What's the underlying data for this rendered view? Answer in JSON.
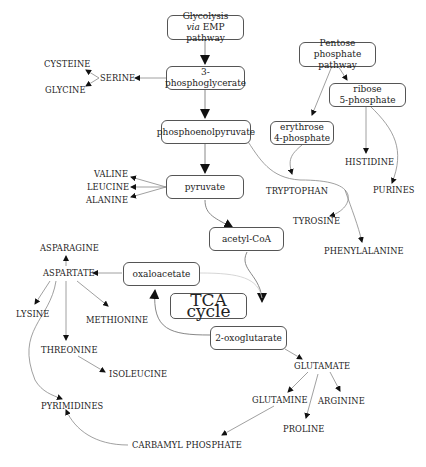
{
  "boxes": {
    "glycolysis": {
      "line1": "Glycolysis",
      "line2_italic": "via",
      "line2": " EMP pathway"
    },
    "pgly": "3-phosphoglycerate",
    "pep": "phosphoenolpyruvate",
    "pyruvate": "pyruvate",
    "acetylcoa": "acetyl-CoA",
    "oxaloacetate": "oxaloacetate",
    "tca": "TCA cycle",
    "oxoglutarate": "2-oxoglutarate",
    "pentose": {
      "line1": "Pentose phosphate",
      "line2": "pathway"
    },
    "ribose": {
      "line1": "ribose",
      "line2": "5-phosphate"
    },
    "erythrose": {
      "line1": "erythrose",
      "line2": "4-phosphate"
    }
  },
  "labels": {
    "serine": "SERINE",
    "cysteine": "CYSTEINE",
    "glycine": "GLYCINE",
    "valine": "VALINE",
    "leucine": "LEUCINE",
    "alanine": "ALANINE",
    "asparagine": "ASPARAGINE",
    "aspartate": "ASPARTATE",
    "lysine": "LYSINE",
    "methionine": "METHIONINE",
    "threonine": "THREONINE",
    "isoleucine": "ISOLEUCINE",
    "pyrimidines": "PYRIMIDINES",
    "carbamyl": "CARBAMYL PHOSPHATE",
    "glutamate": "GLUTAMATE",
    "glutamine": "GLUTAMINE",
    "arginine": "ARGININE",
    "proline": "PROLINE",
    "histidine": "HISTIDINE",
    "purines": "PURINES",
    "tryptophan": "TRYPTOPHAN",
    "tyrosine": "TYROSINE",
    "phenylalanine": "PHENYLALANINE"
  },
  "colors": {
    "line": "#777777",
    "arrow": "#111111",
    "box_border": "#555555"
  }
}
